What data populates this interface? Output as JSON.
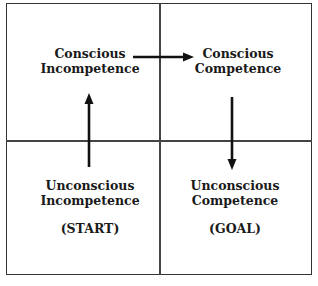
{
  "quadrants": {
    "top_left": {
      "line1": "Conscious",
      "line2": "Incompetence"
    },
    "top_right": {
      "line1": "Conscious",
      "line2": "Competence"
    },
    "bottom_left": {
      "line1": "Unconscious",
      "line2": "Incompetence",
      "tag": "(START)"
    },
    "bottom_right": {
      "line1": "Unconscious",
      "line2": "Competence",
      "tag": "(GOAL)"
    }
  },
  "arrows": [
    {
      "from": "bottom_left",
      "to": "top_left",
      "direction": "up"
    },
    {
      "from": "top_left",
      "to": "top_right",
      "direction": "right"
    },
    {
      "from": "top_right",
      "to": "bottom_right",
      "direction": "down"
    }
  ],
  "colors": {
    "line": "#333333",
    "arrow": "#111111",
    "text": "#1a1a1a"
  }
}
